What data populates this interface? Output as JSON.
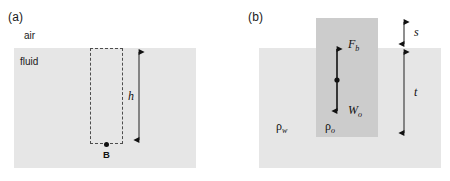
{
  "figure": {
    "width": 450,
    "height": 181,
    "background": "#ffffff",
    "colors": {
      "fluid_fill": "#e6e6e6",
      "water_fill": "#e6e6e6",
      "oil_fill": "#cccccc",
      "line": "#111111",
      "dashed_line": "#4d4d4d",
      "text": "#1a1a1a"
    }
  },
  "panel_a": {
    "label": "(a)",
    "air_label": "air",
    "fluid_label": "fluid",
    "point_label": "B",
    "height_symbol": "h",
    "description": "Dashed rectangular control volume submerged in a fluid with depth h measured from the fluid surface to point B at the bottom of the volume."
  },
  "panel_b": {
    "label": "(b)",
    "water_density_symbol": "ρ",
    "water_density_subscript": "w",
    "oil_density_symbol": "ρ",
    "oil_density_subscript": "o",
    "buoyant_force_symbol": "F",
    "buoyant_force_subscript": "b",
    "weight_symbol": "W",
    "weight_subscript": "o",
    "height_above_symbol": "s",
    "height_below_symbol": "t",
    "description": "A block of oil of density rho_o floating in water of density rho_w, with buoyant force F_b acting upward and weight W_o acting downward; s is the height above the water surface and t is the submerged depth dimension."
  },
  "geometry": {
    "panel_a": {
      "fluid_rect": {
        "x": 14,
        "y": 48,
        "w": 182,
        "h": 120
      },
      "dashed_box": {
        "x": 90,
        "y": 48,
        "w": 33,
        "h": 96
      },
      "dot": {
        "x": 106,
        "y": 144
      },
      "arrow": {
        "x": 139,
        "y_top": 48,
        "y_bottom": 144
      }
    },
    "panel_b": {
      "water_rect": {
        "x": 259,
        "y": 48,
        "w": 182,
        "h": 120
      },
      "oil_rect": {
        "x": 316,
        "y": 18,
        "w": 62,
        "h": 119
      },
      "force_arrow": {
        "x": 337,
        "y_top": 45,
        "y_bottom": 115
      },
      "dim_arrow": {
        "x": 404,
        "y_top": 18,
        "y_mid": 48,
        "y_bottom": 137
      }
    }
  }
}
